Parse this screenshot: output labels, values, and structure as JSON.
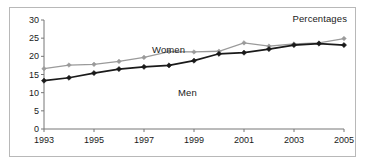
{
  "figure": {
    "note": "Percentages",
    "border_color": "#b8b8b8",
    "background": "#ffffff"
  },
  "chart_data": {
    "type": "line",
    "title": "",
    "subtitle": "",
    "note": "Percentages",
    "xlabel": "",
    "ylabel": "",
    "grid": false,
    "legend_position": "inline-labels",
    "x": [
      1993,
      1994,
      1995,
      1996,
      1997,
      1998,
      1999,
      2000,
      2001,
      2002,
      2003,
      2004,
      2005
    ],
    "xlim": [
      1993,
      2005
    ],
    "ylim": [
      0,
      30
    ],
    "ytick_labels": [
      "0",
      "5",
      "10",
      "15",
      "20",
      "25",
      "30"
    ],
    "yticks": [
      0,
      5,
      10,
      15,
      20,
      25,
      30
    ],
    "xtick_labels": [
      "1993",
      "1995",
      "1997",
      "1999",
      "2001",
      "2003",
      "2005"
    ],
    "xticks": [
      1993,
      1995,
      1997,
      1999,
      2001,
      2003,
      2005
    ],
    "series": [
      {
        "name": "Women",
        "color": "#9a9a9a",
        "marker": "diamond",
        "values": [
          16.6,
          17.6,
          17.8,
          18.6,
          19.7,
          21.3,
          21.2,
          21.4,
          23.7,
          22.8,
          23.4,
          23.7,
          24.9
        ]
      },
      {
        "name": "Men",
        "color": "#1a1a1a",
        "marker": "diamond",
        "values": [
          13.3,
          14.1,
          15.4,
          16.5,
          17.1,
          17.5,
          18.8,
          20.7,
          21.0,
          22.0,
          23.1,
          23.5,
          23.1
        ]
      }
    ]
  }
}
